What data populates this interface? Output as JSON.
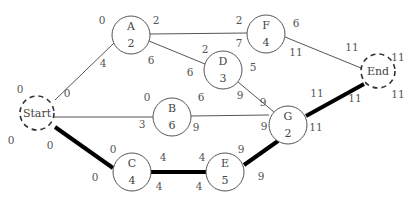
{
  "diagram": {
    "type": "activity-on-node network (critical path)",
    "colors": {
      "edge": "#555555",
      "critical_edge": "#000000",
      "node_stroke": "#555555",
      "text": "#444444"
    },
    "nodes": [
      {
        "id": "start",
        "name": "Start",
        "duration": "",
        "terminal": true,
        "cx": 37,
        "cy": 113,
        "r": 17
      },
      {
        "id": "A",
        "name": "A",
        "duration": "2",
        "terminal": false,
        "cx": 131,
        "cy": 35,
        "r": 19
      },
      {
        "id": "B",
        "name": "B",
        "duration": "6",
        "terminal": false,
        "cx": 172,
        "cy": 117,
        "r": 19
      },
      {
        "id": "C",
        "name": "C",
        "duration": "4",
        "terminal": false,
        "cx": 132,
        "cy": 172,
        "r": 19
      },
      {
        "id": "D",
        "name": "D",
        "duration": "3",
        "terminal": false,
        "cx": 223,
        "cy": 70,
        "r": 19
      },
      {
        "id": "E",
        "name": "E",
        "duration": "5",
        "terminal": false,
        "cx": 225,
        "cy": 172,
        "r": 19
      },
      {
        "id": "F",
        "name": "F",
        "duration": "4",
        "terminal": false,
        "cx": 266,
        "cy": 34,
        "r": 19
      },
      {
        "id": "G",
        "name": "G",
        "duration": "2",
        "terminal": false,
        "cx": 288,
        "cy": 125,
        "r": 19
      },
      {
        "id": "end",
        "name": "End",
        "duration": "",
        "terminal": true,
        "cx": 378,
        "cy": 71,
        "r": 17
      }
    ],
    "edges": [
      {
        "from": "start",
        "to": "A",
        "critical": false,
        "x1": 55,
        "y1": 100,
        "x2": 114,
        "y2": 43
      },
      {
        "from": "start",
        "to": "B",
        "critical": false,
        "x1": 54,
        "y1": 117,
        "x2": 153,
        "y2": 117
      },
      {
        "from": "start",
        "to": "C",
        "critical": true,
        "x1": 55,
        "y1": 127,
        "x2": 113,
        "y2": 168
      },
      {
        "from": "A",
        "to": "F",
        "critical": false,
        "x1": 150,
        "y1": 34,
        "x2": 247,
        "y2": 33
      },
      {
        "from": "A",
        "to": "D",
        "critical": false,
        "x1": 149,
        "y1": 41,
        "x2": 205,
        "y2": 64
      },
      {
        "from": "F",
        "to": "end",
        "critical": false,
        "x1": 285,
        "y1": 37,
        "x2": 361,
        "y2": 68
      },
      {
        "from": "D",
        "to": "G",
        "critical": false,
        "x1": 238,
        "y1": 82,
        "x2": 274,
        "y2": 112
      },
      {
        "from": "B",
        "to": "G",
        "critical": false,
        "x1": 191,
        "y1": 116,
        "x2": 269,
        "y2": 115
      },
      {
        "from": "C",
        "to": "E",
        "critical": true,
        "x1": 151,
        "y1": 172,
        "x2": 206,
        "y2": 172
      },
      {
        "from": "E",
        "to": "G",
        "critical": true,
        "x1": 244,
        "y1": 165,
        "x2": 278,
        "y2": 141
      },
      {
        "from": "G",
        "to": "end",
        "critical": true,
        "x1": 306,
        "y1": 116,
        "x2": 364,
        "y2": 84
      }
    ],
    "labels": [
      {
        "id": "start-es",
        "text": "0",
        "x": 20,
        "y": 93
      },
      {
        "id": "start-ls",
        "text": "0",
        "x": 11,
        "y": 144
      },
      {
        "id": "start-ef",
        "text": "0",
        "x": 67,
        "y": 97
      },
      {
        "id": "start-lf",
        "text": "0",
        "x": 50,
        "y": 149
      },
      {
        "id": "a-es",
        "text": "0",
        "x": 102,
        "y": 24
      },
      {
        "id": "a-ls",
        "text": "4",
        "x": 103,
        "y": 67
      },
      {
        "id": "a-ef",
        "text": "2",
        "x": 156,
        "y": 24
      },
      {
        "id": "a-lf",
        "text": "6",
        "x": 151,
        "y": 64
      },
      {
        "id": "f-es",
        "text": "2",
        "x": 239,
        "y": 24
      },
      {
        "id": "f-ls",
        "text": "7",
        "x": 239,
        "y": 47
      },
      {
        "id": "f-ef",
        "text": "6",
        "x": 296,
        "y": 27
      },
      {
        "id": "f-lf",
        "text": "11",
        "x": 296,
        "y": 56
      },
      {
        "id": "d-es",
        "text": "2",
        "x": 205,
        "y": 53
      },
      {
        "id": "d-ls",
        "text": "6",
        "x": 190,
        "y": 76
      },
      {
        "id": "d-ef",
        "text": "5",
        "x": 253,
        "y": 71
      },
      {
        "id": "d-lf",
        "text": "9",
        "x": 240,
        "y": 99
      },
      {
        "id": "b-es",
        "text": "0",
        "x": 147,
        "y": 101
      },
      {
        "id": "b-ls",
        "text": "3",
        "x": 142,
        "y": 128
      },
      {
        "id": "b-ef",
        "text": "6",
        "x": 201,
        "y": 101
      },
      {
        "id": "b-lf",
        "text": "9",
        "x": 196,
        "y": 131
      },
      {
        "id": "g-es",
        "text": "9",
        "x": 263,
        "y": 106
      },
      {
        "id": "g-ls",
        "text": "9",
        "x": 264,
        "y": 130
      },
      {
        "id": "g-ef",
        "text": "11",
        "x": 317,
        "y": 97
      },
      {
        "id": "g-lf",
        "text": "11",
        "x": 316,
        "y": 131
      },
      {
        "id": "end-es",
        "text": "11",
        "x": 352,
        "y": 51
      },
      {
        "id": "end-ls",
        "text": "11",
        "x": 355,
        "y": 102
      },
      {
        "id": "end-ef",
        "text": "11",
        "x": 398,
        "y": 61
      },
      {
        "id": "end-lf",
        "text": "11",
        "x": 398,
        "y": 98
      },
      {
        "id": "c-es",
        "text": "0",
        "x": 113,
        "y": 153
      },
      {
        "id": "c-ls",
        "text": "0",
        "x": 95,
        "y": 181
      },
      {
        "id": "c-ef",
        "text": "4",
        "x": 163,
        "y": 161
      },
      {
        "id": "c-lf",
        "text": "4",
        "x": 159,
        "y": 190
      },
      {
        "id": "e-es",
        "text": "4",
        "x": 202,
        "y": 161
      },
      {
        "id": "e-ls",
        "text": "4",
        "x": 199,
        "y": 190
      },
      {
        "id": "e-ef",
        "text": "9",
        "x": 241,
        "y": 153
      },
      {
        "id": "e-lf",
        "text": "9",
        "x": 261,
        "y": 180
      }
    ]
  }
}
